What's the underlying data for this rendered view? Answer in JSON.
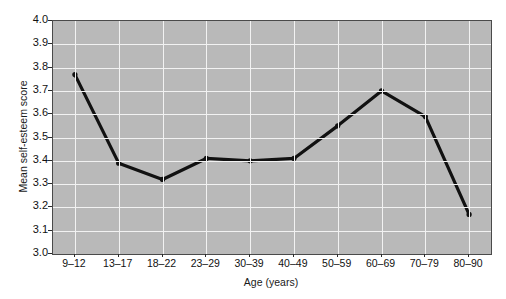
{
  "chart_data": {
    "type": "line",
    "title": "",
    "xlabel": "Age (years)",
    "ylabel": "Mean self-esteem score",
    "categories": [
      "9–12",
      "13–17",
      "18–22",
      "23–29",
      "30–39",
      "40–49",
      "50–59",
      "60–69",
      "70–79",
      "80–90"
    ],
    "values": [
      3.77,
      3.39,
      3.32,
      3.41,
      3.4,
      3.41,
      3.55,
      3.7,
      3.59,
      3.17
    ],
    "ylim": [
      3.0,
      4.0
    ],
    "ytick_labels": [
      "4.0",
      "3.9",
      "3.8",
      "3.7",
      "3.6",
      "3.5",
      "3.4",
      "3.3",
      "3.2",
      "3.1",
      "3.0"
    ],
    "ytick_values": [
      4.0,
      3.9,
      3.8,
      3.7,
      3.6,
      3.5,
      3.4,
      3.3,
      3.2,
      3.1,
      3.0
    ],
    "ytick_step": 0.1,
    "grid": true,
    "grid_color": "#f2f2f2",
    "plot_background": "#b9b9b9",
    "line_color": "#111111",
    "marker_color": "#111111",
    "legend": null,
    "legend_position": "none"
  }
}
